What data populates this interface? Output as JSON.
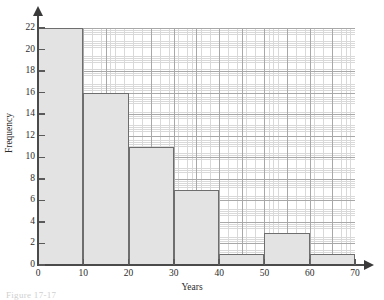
{
  "figure": {
    "caption": "Figure 17-17"
  },
  "chart_data": {
    "type": "bar",
    "title": "",
    "xlabel": "Years",
    "ylabel": "Frequency",
    "xlim": [
      0,
      70
    ],
    "ylim": [
      0,
      22
    ],
    "bin_width": 10,
    "grid": true,
    "legend": "none",
    "categories": [
      "0-10",
      "10-20",
      "20-30",
      "30-40",
      "40-50",
      "50-60",
      "60-70"
    ],
    "bin_edges": [
      0,
      10,
      20,
      30,
      40,
      50,
      60,
      70
    ],
    "values": [
      22,
      16,
      11,
      7,
      1,
      3,
      1
    ],
    "xticks": [
      "0",
      "10",
      "20",
      "30",
      "40",
      "50",
      "60",
      "70"
    ],
    "xtick_values": [
      0,
      10,
      20,
      30,
      40,
      50,
      60,
      70
    ],
    "yticks": [
      "0",
      "2",
      "4",
      "6",
      "8",
      "10",
      "12",
      "14",
      "16",
      "18",
      "20",
      "22"
    ],
    "ytick_values": [
      0,
      2,
      4,
      6,
      8,
      10,
      12,
      14,
      16,
      18,
      20,
      22
    ],
    "colors": {
      "bar_fill": "#e3e3e3",
      "bar_edge": "#6e6e6e",
      "grid_minor": "#d9d9d9",
      "grid_major": "#a8a8a8",
      "axis": "#4a4a4a",
      "text": "#2b2b2b",
      "background": "#ffffff"
    }
  }
}
